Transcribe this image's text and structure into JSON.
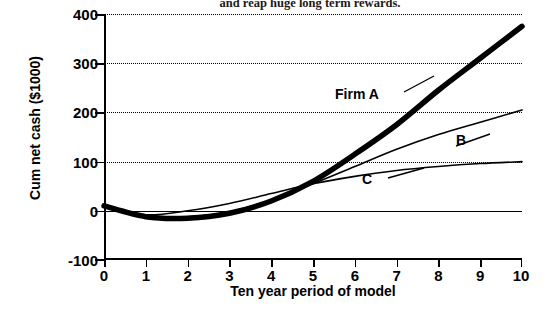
{
  "title": "and reap huge long term rewards.",
  "axis": {
    "x_title": "Ten year period of model",
    "y_title": "Cum net cash ($1000)",
    "y_ticks": [
      "400",
      "300",
      "200",
      "100",
      "0",
      "-100"
    ],
    "x_ticks": [
      "0",
      "1",
      "2",
      "3",
      "4",
      "5",
      "6",
      "7",
      "8",
      "9",
      "10"
    ]
  },
  "labels": {
    "firm_a": "Firm A",
    "b": "B",
    "c": "C"
  },
  "chart_data": {
    "type": "line",
    "title": "and reap huge long term rewards.",
    "xlabel": "Ten year period of model",
    "ylabel": "Cum net cash ($1000)",
    "xlim": [
      0,
      10
    ],
    "ylim": [
      -100,
      400
    ],
    "grid": true,
    "grid_style": "dotted horizontal at 100, 200, 300, 400",
    "legend": "inline annotations at curve ends",
    "x": [
      0,
      1,
      2,
      3,
      4,
      5,
      6,
      7,
      8,
      9,
      10
    ],
    "series": [
      {
        "name": "Firm A",
        "line_weight": "thick",
        "values": [
          10,
          -12,
          -15,
          -5,
          20,
          60,
          115,
          175,
          245,
          310,
          375
        ]
      },
      {
        "name": "B",
        "line_weight": "thin",
        "values": [
          8,
          -10,
          -12,
          -2,
          22,
          55,
          90,
          125,
          155,
          180,
          205
        ]
      },
      {
        "name": "C",
        "line_weight": "thin",
        "values": [
          8,
          -8,
          0,
          15,
          35,
          55,
          70,
          82,
          90,
          96,
          100
        ]
      }
    ]
  }
}
